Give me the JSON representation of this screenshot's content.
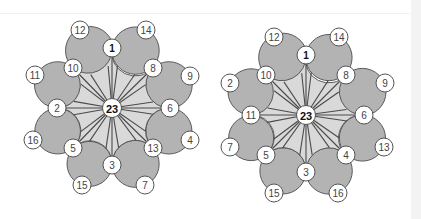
{
  "diagrams": [
    {
      "id": "left",
      "center": {
        "label": "23",
        "x": 112,
        "y": 108
      },
      "inner_nodes": [
        {
          "label": "1",
          "x": 112,
          "y": 48
        },
        {
          "label": "8",
          "x": 153,
          "y": 68
        },
        {
          "label": "6",
          "x": 170,
          "y": 108
        },
        {
          "label": "13",
          "x": 153,
          "y": 148
        },
        {
          "label": "3",
          "x": 112,
          "y": 165
        },
        {
          "label": "5",
          "x": 73,
          "y": 148
        },
        {
          "label": "2",
          "x": 57,
          "y": 108
        },
        {
          "label": "10",
          "x": 73,
          "y": 68
        }
      ],
      "outer_nodes": [
        {
          "label": "14",
          "x": 146,
          "y": 30
        },
        {
          "label": "9",
          "x": 190,
          "y": 76
        },
        {
          "label": "4",
          "x": 190,
          "y": 140
        },
        {
          "label": "7",
          "x": 145,
          "y": 185
        },
        {
          "label": "15",
          "x": 82,
          "y": 185
        },
        {
          "label": "16",
          "x": 33,
          "y": 140
        },
        {
          "label": "11",
          "x": 35,
          "y": 75
        },
        {
          "label": "12",
          "x": 80,
          "y": 30
        }
      ]
    },
    {
      "id": "right",
      "center": {
        "label": "23",
        "x": 306,
        "y": 115
      },
      "inner_nodes": [
        {
          "label": "1",
          "x": 306,
          "y": 55
        },
        {
          "label": "8",
          "x": 346,
          "y": 75
        },
        {
          "label": "6",
          "x": 364,
          "y": 115
        },
        {
          "label": "4",
          "x": 346,
          "y": 155
        },
        {
          "label": "3",
          "x": 306,
          "y": 172
        },
        {
          "label": "5",
          "x": 266,
          "y": 155
        },
        {
          "label": "11",
          "x": 251,
          "y": 115
        },
        {
          "label": "10",
          "x": 266,
          "y": 75
        }
      ],
      "outer_nodes": [
        {
          "label": "14",
          "x": 339,
          "y": 37
        },
        {
          "label": "9",
          "x": 385,
          "y": 83
        },
        {
          "label": "13",
          "x": 384,
          "y": 147
        },
        {
          "label": "16",
          "x": 338,
          "y": 193
        },
        {
          "label": "15",
          "x": 274,
          "y": 193
        },
        {
          "label": "7",
          "x": 230,
          "y": 147
        },
        {
          "label": "2",
          "x": 230,
          "y": 83
        },
        {
          "label": "12",
          "x": 274,
          "y": 37
        }
      ]
    }
  ],
  "colors": {
    "petal": "#b3b3b3",
    "hub": "#d9d9d9",
    "node": "#ffffff",
    "stroke": "#555555"
  }
}
